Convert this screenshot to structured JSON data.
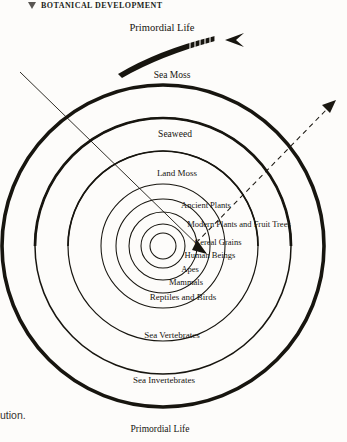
{
  "header": {
    "marker_icon": "triangle-down-icon",
    "title": "BOTANICAL DEVELOPMENT"
  },
  "diagram": {
    "kind": "concentric-rings",
    "center": {
      "x": 163,
      "y": 246
    },
    "background_color": "#fdfcfa",
    "stroke_color": "#17150f",
    "rings": [
      {
        "label": "Primordial Life",
        "radius": 161,
        "thickness": 3.4,
        "label_position": "bottom-outside"
      },
      {
        "label": "Sea Invertebrates",
        "radius": 128,
        "thickness": 1.2,
        "label_position": "bottom-inside"
      },
      {
        "label": "Sea Vertebrates",
        "radius": 95,
        "thickness": 1.2,
        "label_position": "bottom-inside"
      },
      {
        "label": "Reptiles and Birds",
        "radius": 62,
        "thickness": 1.0,
        "label_position": "bottom-inside"
      },
      {
        "label": "Mammals",
        "radius": 47,
        "thickness": 1.0,
        "label_position": "bottom-inside"
      },
      {
        "label": "Apes",
        "radius": 34,
        "thickness": 1.0,
        "label_position": "bottom-inside"
      },
      {
        "label": "Human Beings",
        "radius": 22,
        "thickness": 1.0,
        "label_position": "bottom-inside"
      },
      {
        "label": "Cereal Grains",
        "radius": 13,
        "thickness": 1.0,
        "label_position": "center"
      }
    ],
    "upper_rings": [
      {
        "label": "Sea Moss",
        "radius": 161,
        "thickness": 3.4
      },
      {
        "label": "Seaweed",
        "radius": 128,
        "thickness": 2.6
      },
      {
        "label": "Land Moss",
        "radius": 95,
        "thickness": 1.6
      },
      {
        "label": "Ancient Plants",
        "radius": 62,
        "thickness": 1.2
      },
      {
        "label": "Modern Plants and Fruit Trees",
        "radius": 41,
        "thickness": 1.0
      }
    ],
    "labels": {
      "primordial_top": "Primordial Life",
      "sea_moss": "Sea Moss",
      "seaweed": "Seaweed",
      "land_moss": "Land Moss",
      "ancient_plants": "Ancient Plants",
      "modern_plants": "Modern Plants and Fruit Trees",
      "cereal_grains": "Cereal Grains",
      "human_beings": "Human Beings",
      "apes": "Apes",
      "mammals": "Mammals",
      "reptiles_birds": "Reptiles and Birds",
      "sea_vertebrates": "Sea Vertebrates",
      "sea_invertebrates": "Sea Invertebrates",
      "primordial_bottom": "Primordial Life"
    },
    "annotations": [
      {
        "name": "tapered-arrow-top",
        "icon": "tapered-arrow-icon",
        "style": "solid-tapered-hatched",
        "direction": "right",
        "from": {
          "x": 178,
          "y": 57
        },
        "to": {
          "x": 243,
          "y": 35
        }
      },
      {
        "name": "solid-diagonal-line",
        "icon": "diagonal-line-icon",
        "style": "thin-solid",
        "from": {
          "x": 20,
          "y": 72
        },
        "to": {
          "x": 203,
          "y": 250
        }
      },
      {
        "name": "dashed-arrow-outward",
        "icon": "dashed-arrow-icon",
        "style": "dashed",
        "direction": "up-right",
        "from": {
          "x": 196,
          "y": 243
        },
        "to": {
          "x": 336,
          "y": 101
        }
      }
    ]
  },
  "caption_fragment": "ution."
}
